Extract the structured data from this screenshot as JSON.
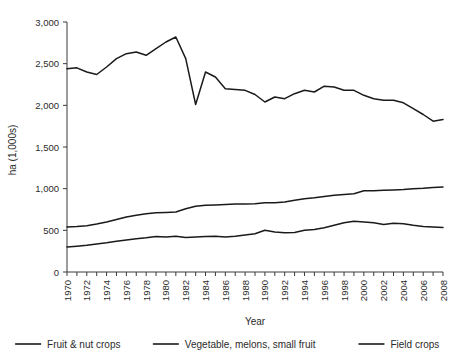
{
  "chart_data": {
    "type": "line",
    "title": "",
    "xlabel": "Year",
    "ylabel": "ha (1,000s)",
    "xlim": [
      1970,
      2008
    ],
    "ylim": [
      0,
      3000
    ],
    "ytick_values": [
      0,
      500,
      1000,
      1500,
      2000,
      2500,
      3000
    ],
    "ytick_labels": [
      "0",
      "500",
      "1,000",
      "1,500",
      "2,000",
      "2,500",
      "3,000"
    ],
    "xtick_labels": [
      "1970",
      "1972",
      "1974",
      "1976",
      "1978",
      "1980",
      "1982",
      "1984",
      "1986",
      "1988",
      "1990",
      "1992",
      "1994",
      "1996",
      "1998",
      "2000",
      "2002",
      "2004",
      "2006",
      "2008"
    ],
    "x": [
      1970,
      1971,
      1972,
      1973,
      1974,
      1975,
      1976,
      1977,
      1978,
      1979,
      1980,
      1981,
      1982,
      1983,
      1984,
      1985,
      1986,
      1987,
      1988,
      1989,
      1990,
      1991,
      1992,
      1993,
      1994,
      1995,
      1996,
      1997,
      1998,
      1999,
      2000,
      2001,
      2002,
      2003,
      2004,
      2005,
      2006,
      2007,
      2008
    ],
    "grid": false,
    "legend_position": "bottom",
    "series": [
      {
        "name": "Fruit & nut crops",
        "color": "#1a1a1a",
        "values": [
          2440,
          2450,
          2400,
          2370,
          2460,
          2560,
          2620,
          2640,
          2600,
          2680,
          2760,
          2820,
          2560,
          2010,
          2400,
          2340,
          2200,
          2190,
          2180,
          2130,
          2040,
          2100,
          2080,
          2140,
          2180,
          2160,
          2230,
          2220,
          2180,
          2180,
          2120,
          2080,
          2060,
          2060,
          2030,
          1960,
          1890,
          1810,
          1830
        ]
      },
      {
        "name": "Vegetable, melons, small fruit",
        "color": "#1a1a1a",
        "values": [
          300,
          310,
          320,
          335,
          350,
          370,
          385,
          400,
          410,
          425,
          420,
          430,
          415,
          420,
          425,
          430,
          420,
          430,
          445,
          460,
          500,
          480,
          470,
          475,
          500,
          510,
          530,
          560,
          590,
          610,
          600,
          590,
          570,
          585,
          580,
          560,
          545,
          540,
          535
        ]
      },
      {
        "name": "Field crops",
        "color": "#1a1a1a",
        "values": [
          540,
          545,
          555,
          575,
          600,
          630,
          660,
          680,
          700,
          710,
          715,
          720,
          760,
          790,
          800,
          805,
          810,
          815,
          815,
          820,
          830,
          830,
          840,
          860,
          880,
          890,
          905,
          920,
          930,
          940,
          975,
          975,
          980,
          985,
          990,
          1000,
          1005,
          1015,
          1020
        ]
      }
    ]
  },
  "legend": {
    "items": [
      {
        "label": "Fruit & nut crops"
      },
      {
        "label": "Vegetable, melons, small fruit"
      },
      {
        "label": "Field crops"
      }
    ]
  }
}
